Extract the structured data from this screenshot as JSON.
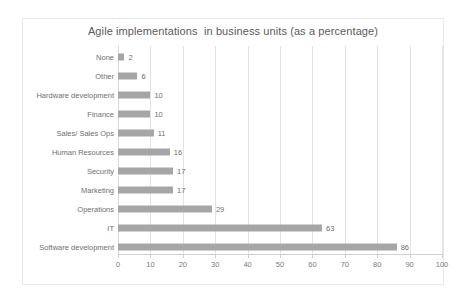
{
  "chart_data": {
    "type": "bar",
    "orientation": "horizontal",
    "title": "Agile implementations  in business units (as a percentage)",
    "xlabel": "",
    "ylabel": "",
    "xlim": [
      0,
      100
    ],
    "xticks": [
      "0",
      "10",
      "20",
      "30",
      "40",
      "50",
      "60",
      "70",
      "80",
      "90",
      "100"
    ],
    "grid": "vertical",
    "legend": "none",
    "bar_color": "#a6a6a6",
    "categories": [
      "None",
      "Other",
      "Hardware development",
      "Finance",
      "Sales/ Sales Ops",
      "Human Resources",
      "Security",
      "Marketing",
      "Operations",
      "IT",
      "Software development"
    ],
    "values": [
      2,
      6,
      10,
      10,
      11,
      16,
      17,
      17,
      29,
      63,
      86
    ],
    "data_labels": [
      "2",
      "6",
      "10",
      "10",
      "11",
      "16",
      "17",
      "17",
      "29",
      "63",
      "86"
    ]
  }
}
